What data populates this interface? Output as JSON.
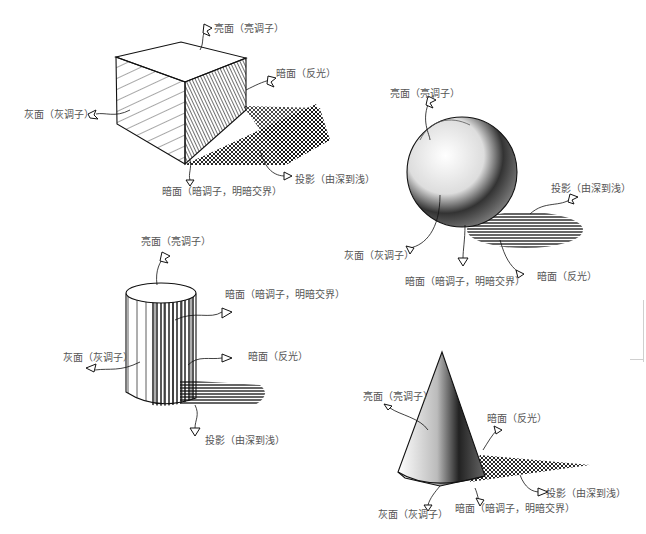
{
  "figure": {
    "objects": [
      {
        "name": "cube",
        "labels": {
          "light": "亮面（亮调子）",
          "reflected": "暗面（反光）",
          "gray": "灰面（灰调子）",
          "dark": "暗面（暗调子，明暗交界）",
          "shadow": "投影（由深到浅）"
        }
      },
      {
        "name": "sphere",
        "labels": {
          "light": "亮面（亮调子）",
          "shadow": "投影（由深到浅）",
          "gray": "灰面（灰调子）",
          "dark": "暗面（暗调子，明暗交界）",
          "reflected": "暗面（反光）"
        }
      },
      {
        "name": "cylinder",
        "labels": {
          "light": "亮面（亮调子）",
          "dark": "暗面（暗调子，明暗交界）",
          "gray": "灰面（灰调子）",
          "reflected": "暗面（反光）",
          "shadow": "投影（由深到浅）"
        }
      },
      {
        "name": "cone",
        "labels": {
          "light": "亮面（亮调子）",
          "reflected": "暗面（反光）",
          "shadow": "投影（由深到浅）",
          "gray": "灰面（灰调子）",
          "dark": "暗面（暗调子，明暗交界）"
        }
      }
    ]
  },
  "colors": {
    "background": "#ffffff",
    "ink": "#111111",
    "label_text": "#555555"
  }
}
